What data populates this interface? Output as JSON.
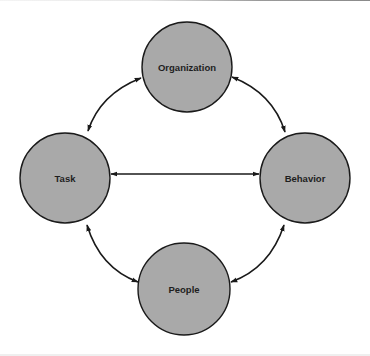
{
  "diagram": {
    "type": "cycle-relationship",
    "node_fill": "#a9a9a9",
    "node_stroke": "#1a1a1a",
    "edge_color": "#1a1a1a",
    "nodes": [
      {
        "id": "organization",
        "label": "Organization",
        "cx": 187,
        "cy": 67,
        "r": 45
      },
      {
        "id": "task",
        "label": "Task",
        "cx": 65,
        "cy": 178,
        "r": 45
      },
      {
        "id": "behavior",
        "label": "Behavior",
        "cx": 305,
        "cy": 178,
        "r": 45
      },
      {
        "id": "people",
        "label": "People",
        "cx": 184,
        "cy": 289,
        "r": 46
      }
    ],
    "edges": [
      {
        "from": "organization",
        "to": "task",
        "bidirectional": true
      },
      {
        "from": "organization",
        "to": "behavior",
        "bidirectional": true
      },
      {
        "from": "task",
        "to": "behavior",
        "bidirectional": true
      },
      {
        "from": "task",
        "to": "people",
        "bidirectional": true
      },
      {
        "from": "behavior",
        "to": "people",
        "bidirectional": true
      }
    ]
  }
}
